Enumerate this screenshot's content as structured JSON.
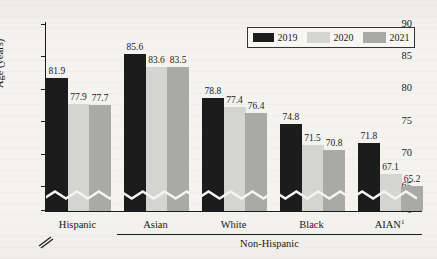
{
  "chart_data": {
    "type": "bar",
    "title": "",
    "subtitle": "",
    "xlabel": "",
    "ylabel": "Age (years)",
    "categories": [
      "Hispanic",
      "Asian",
      "White",
      "Black",
      "AIAN"
    ],
    "category_superscripts": [
      "",
      "",
      "",
      "",
      "1"
    ],
    "group_bracket_label": "Non-Hispanic",
    "group_bracket_categories": [
      "Asian",
      "White",
      "Black",
      "AIAN"
    ],
    "series": [
      {
        "name": "2019",
        "color": "#1c1c1c",
        "values": [
          81.9,
          85.6,
          78.8,
          74.8,
          71.8
        ]
      },
      {
        "name": "2020",
        "color": "#d4d4d2",
        "values": [
          77.9,
          83.6,
          77.4,
          71.5,
          67.1
        ]
      },
      {
        "name": "2021",
        "color": "#a9a9a7",
        "values": [
          77.7,
          83.5,
          76.4,
          70.8,
          65.2
        ]
      }
    ],
    "ylim": [
      63.5,
      90
    ],
    "yticks": [
      0,
      65,
      70,
      75,
      80,
      85,
      90
    ],
    "ytick_labels": [
      "0",
      "65",
      "70",
      "75",
      "80",
      "85",
      "90"
    ],
    "axis_break": true,
    "axis_break_note": "y-axis broken between 0 and 65",
    "grid": false,
    "legend_position": "top-right",
    "legend_entries": [
      "2019",
      "2020",
      "2021"
    ]
  },
  "legend": {
    "items": [
      {
        "label": "2019"
      },
      {
        "label": "2020"
      },
      {
        "label": "2021"
      }
    ]
  }
}
